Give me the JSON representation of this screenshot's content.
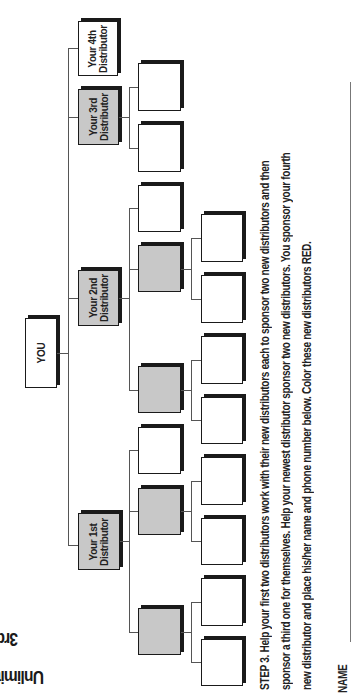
{
  "title": {
    "line1": "3rd GOAL SHEET",
    "line2": "Unlimited Width Plan"
  },
  "tree": {
    "root": {
      "label": "YOU"
    },
    "distributors": [
      {
        "label_line1": "Your 1st",
        "label_line2": "Distributor",
        "fill": "gray"
      },
      {
        "label_line1": "Your 2nd",
        "label_line2": "Distributor",
        "fill": "gray"
      },
      {
        "label_line1": "Your 3rd",
        "label_line2": "Distributor",
        "fill": "gray"
      },
      {
        "label_line1": "Your 4th",
        "label_line2": "Distributor",
        "fill": "white"
      }
    ],
    "level2_fills": [
      "white",
      "white",
      "white",
      "gray",
      "gray",
      "white",
      "gray",
      "gray"
    ],
    "level3_count": 12
  },
  "instructions": {
    "line1": "STEP 3. Help your first two distributors work with their new distributors each to sponsor two new distributors and then",
    "line2": "sponsor a third one for themselves. Help your newest distributor sponsor two new distributors. You sponsor your fourth",
    "line3": "new distributor and place his/her name and phone number below. Color these new distributors RED."
  },
  "form": {
    "name_label": "NAME"
  },
  "colors": {
    "gray_fill": "#c8c8c8",
    "ink": "#1a1a1a"
  }
}
